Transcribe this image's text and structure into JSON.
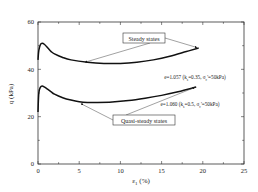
{
  "chart_data": {
    "type": "line",
    "title": "",
    "xlabel": "ε1 (%)",
    "ylabel": "q (kPa)",
    "xlim": [
      0,
      25
    ],
    "ylim": [
      0,
      60
    ],
    "xticks": [
      0,
      5,
      10,
      15,
      20,
      25
    ],
    "yticks": [
      0,
      20,
      40,
      60
    ],
    "grid": false,
    "series": [
      {
        "name": "e=1.057 (ks=0.35, σc'=50kPa)",
        "x": [
          0,
          0.1,
          0.3,
          0.5,
          0.8,
          1.2,
          1.6,
          2.0,
          3.0,
          4.0,
          6.0,
          8.0,
          10.0,
          12.0,
          14.0,
          16.0,
          18.0,
          19.5
        ],
        "y": [
          44,
          48,
          50.5,
          51,
          50.5,
          49,
          47.5,
          46.5,
          45,
          44,
          43,
          42.5,
          42.5,
          43,
          44,
          45.5,
          47.5,
          49
        ]
      },
      {
        "name": "e=1.060 (ks=0.5, σc'=50kPa)",
        "x": [
          0,
          0.1,
          0.3,
          0.5,
          0.8,
          1.2,
          1.6,
          2.0,
          3.0,
          4.0,
          5.0,
          6.0,
          7.0,
          9.0,
          11.0,
          13.0,
          15.0,
          17.0,
          19.2
        ],
        "y": [
          22,
          30,
          32.5,
          33,
          32.5,
          31.5,
          30.5,
          29.5,
          28,
          27,
          26.3,
          26,
          26,
          26.2,
          26.8,
          27.8,
          29,
          30.5,
          32.5
        ]
      }
    ],
    "annotations": [
      {
        "text": "Steady states",
        "boxed": true,
        "points_to": [
          "upper-curve-end",
          "upper-curve-min"
        ]
      },
      {
        "text": "Quasi-steady states",
        "boxed": true,
        "points_to": [
          "lower-curve-min",
          "lower-curve-end"
        ]
      },
      {
        "text": "e=1.057 (ks=0.35, σc'=50kPa)",
        "label_for": "upper series"
      },
      {
        "text": "e=1.060 (ks=0.5, σc'=50kPa)",
        "label_for": "lower series"
      }
    ],
    "legend": "none"
  },
  "labels": {
    "xlabel_main": "ε",
    "xlabel_sub": "1",
    "xlabel_unit": " (%)",
    "ylabel": "q (kPa)",
    "steady": "Steady states",
    "quasi": "Quasi-steady states",
    "s1_e": "e=1.057 (k",
    "s1_ks_sub": "s",
    "s1_ks_val": "=0.35, σ",
    "s1_c_sub": "c",
    "s1_tail": "'=50kPa)",
    "s2_e": "e=1.060 (k",
    "s2_ks_sub": "s",
    "s2_ks_val": "=0.5, σ",
    "s2_c_sub": "c",
    "s2_tail": "'=50kPa)"
  }
}
